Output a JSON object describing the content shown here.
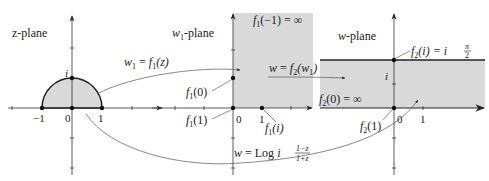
{
  "diagram": {
    "type": "conformal-mapping",
    "panels": [
      {
        "id": "z-plane",
        "title": "z-plane",
        "region": "upper half unit disk (shaded)",
        "tick_labels": [
          "−1",
          "0",
          "1",
          "i"
        ],
        "points": [
          "-1",
          "0",
          "1",
          "i"
        ]
      },
      {
        "id": "w1-plane",
        "title": "w₁-plane",
        "region": "first quadrant (shaded)",
        "tick_labels": [
          "0",
          "1"
        ],
        "annotations": [
          "f₁(−1)=∞",
          "f₁(0)",
          "f₁(1)",
          "f₁(i)"
        ]
      },
      {
        "id": "w-plane",
        "title": "w-plane",
        "region": "horizontal strip 0 < Im w < π/2 (shaded)",
        "tick_labels": [
          "0",
          "1",
          "i"
        ],
        "annotations": [
          "f₂(i)=iπ/2",
          "f₂(0)=∞",
          "f₂(1)"
        ]
      }
    ],
    "arrows": [
      {
        "from": "z-plane",
        "to": "w1-plane",
        "label": "w₁=f₁(z)"
      },
      {
        "from": "w1-plane",
        "to": "w-plane",
        "label": "w=f₂(w₁)"
      },
      {
        "from": "z-plane",
        "to": "w-plane",
        "label": "w=Log i(1−z)/(1+z)"
      }
    ]
  },
  "labels": {
    "z_title": "z-plane",
    "w1_title_w": "w",
    "w1_title_sub": "1",
    "w1_title_rest": "-plane",
    "w_title": "w-plane",
    "z_m1": "−1",
    "z_0": "0",
    "z_1": "1",
    "z_i": "i",
    "map1": "w",
    "map1_sub": "1",
    "map1_eq": " = f",
    "map1_sub2": "1",
    "map1_arg": "(z)",
    "f1_m1": "(−1) = ∞",
    "f1_0": "(0)",
    "f1_1": "(1)",
    "f1_i": "(i)",
    "w1_0": "0",
    "w1_1": "1",
    "map2": "w = f",
    "map2_arg": "(w",
    "map2_close": ")",
    "f2_i": "(i) = i",
    "f2_0": "(0) = ∞",
    "f2_1": "(1)",
    "w_0": "0",
    "w_1": "1",
    "w_i": "i",
    "pi": "π",
    "two": "2",
    "log_eq": "w = Log i",
    "frac_num": "1−z",
    "frac_den": "1+z",
    "f": "f",
    "sub1": "1",
    "sub2": "2"
  }
}
